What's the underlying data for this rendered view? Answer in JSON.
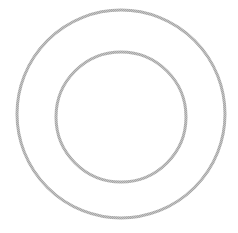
{
  "diagram": {
    "shapes": [
      {
        "name": "outer-circle",
        "kind": "circle",
        "fill": "none"
      },
      {
        "name": "inner-circle",
        "kind": "circle",
        "fill": "none"
      }
    ],
    "colors": {
      "stroke": "#b4b4b4",
      "background": "#ffffff"
    }
  }
}
